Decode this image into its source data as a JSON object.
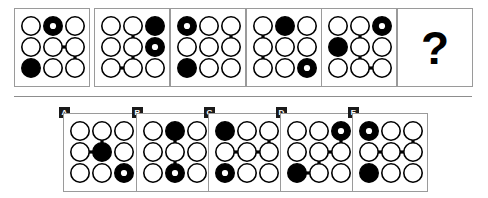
{
  "puzzle": {
    "type": "matrix-reasoning-multiple-choice",
    "question_mark": "?",
    "grid_size": 3,
    "node_states": {
      "empty": "open-circle",
      "filled": "solid-black-circle",
      "dotted": "black-circle-with-white-dot"
    },
    "sequence": [
      {
        "id": "seq-1",
        "nodes": [
          "empty",
          "dotted",
          "empty",
          "empty",
          "empty",
          "empty",
          "filled",
          "empty",
          "empty"
        ],
        "edges": [
          [
            4,
            5
          ],
          [
            5,
            8
          ]
        ]
      },
      {
        "id": "seq-2",
        "nodes": [
          "empty",
          "empty",
          "filled",
          "empty",
          "empty",
          "dotted",
          "empty",
          "empty",
          "empty"
        ],
        "edges": [
          [
            1,
            4
          ],
          [
            4,
            7
          ],
          [
            6,
            7
          ]
        ]
      },
      {
        "id": "seq-3",
        "nodes": [
          "dotted",
          "empty",
          "empty",
          "empty",
          "empty",
          "empty",
          "filled",
          "empty",
          "empty"
        ],
        "edges": [
          [
            2,
            5
          ]
        ]
      },
      {
        "id": "seq-4",
        "nodes": [
          "empty",
          "filled",
          "empty",
          "empty",
          "empty",
          "empty",
          "empty",
          "empty",
          "dotted"
        ],
        "edges": [
          [
            0,
            3
          ],
          [
            3,
            6
          ]
        ]
      },
      {
        "id": "seq-5",
        "nodes": [
          "empty",
          "empty",
          "dotted",
          "filled",
          "empty",
          "empty",
          "empty",
          "empty",
          "empty"
        ],
        "edges": [
          [
            1,
            4
          ],
          [
            4,
            7
          ],
          [
            7,
            8
          ]
        ]
      },
      {
        "id": "seq-6-question",
        "is_question": true,
        "nodes": [],
        "edges": []
      }
    ],
    "options": [
      {
        "id": "option-a",
        "label": "A",
        "nodes": [
          "empty",
          "empty",
          "empty",
          "empty",
          "filled",
          "empty",
          "empty",
          "empty",
          "dotted"
        ],
        "edges": [
          [
            1,
            4
          ],
          [
            3,
            4
          ]
        ]
      },
      {
        "id": "option-b",
        "label": "B",
        "nodes": [
          "empty",
          "filled",
          "empty",
          "empty",
          "empty",
          "empty",
          "empty",
          "dotted",
          "empty"
        ],
        "edges": [
          [
            1,
            4
          ],
          [
            4,
            7
          ]
        ]
      },
      {
        "id": "option-c",
        "label": "C",
        "nodes": [
          "filled",
          "empty",
          "empty",
          "empty",
          "empty",
          "empty",
          "dotted",
          "empty",
          "empty"
        ],
        "edges": [
          [
            2,
            5
          ],
          [
            3,
            4
          ],
          [
            4,
            5
          ]
        ]
      },
      {
        "id": "option-d",
        "label": "D",
        "nodes": [
          "empty",
          "empty",
          "dotted",
          "empty",
          "empty",
          "empty",
          "filled",
          "empty",
          "empty"
        ],
        "edges": [
          [
            2,
            5
          ],
          [
            4,
            5
          ],
          [
            4,
            7
          ],
          [
            6,
            7
          ]
        ]
      },
      {
        "id": "option-e",
        "label": "E",
        "nodes": [
          "dotted",
          "empty",
          "empty",
          "empty",
          "empty",
          "empty",
          "filled",
          "empty",
          "empty"
        ],
        "edges": [
          [
            2,
            5
          ],
          [
            3,
            4
          ],
          [
            4,
            5
          ]
        ]
      }
    ],
    "colors": {
      "stroke": "#000000",
      "fill_black": "#000000",
      "panel_border": "#9a9a9a",
      "divider": "#8d8d8d",
      "background": "#ffffff",
      "label_background": "#1a1a1a",
      "label_text": "#ffffff"
    },
    "layout": {
      "sequence_panels": [
        {
          "x": 14,
          "y": 8,
          "w": 76,
          "h": 79
        },
        {
          "x": 94,
          "y": 8,
          "w": 76,
          "h": 79
        },
        {
          "x": 170,
          "y": 8,
          "w": 76,
          "h": 79
        },
        {
          "x": 246,
          "y": 8,
          "w": 76,
          "h": 79
        },
        {
          "x": 321,
          "y": 8,
          "w": 76,
          "h": 79
        },
        {
          "x": 397,
          "y": 8,
          "w": 76,
          "h": 79
        }
      ],
      "option_panels": [
        {
          "x": 63,
          "y": 113,
          "w": 76,
          "h": 79,
          "label_x": 59,
          "label_y": 107
        },
        {
          "x": 136,
          "y": 113,
          "w": 76,
          "h": 79,
          "label_x": 132,
          "label_y": 107
        },
        {
          "x": 208,
          "y": 113,
          "w": 76,
          "h": 79,
          "label_x": 204,
          "label_y": 107
        },
        {
          "x": 280,
          "y": 113,
          "w": 76,
          "h": 79,
          "label_x": 276,
          "label_y": 107
        },
        {
          "x": 352,
          "y": 113,
          "w": 76,
          "h": 79,
          "label_x": 348,
          "label_y": 107
        }
      ]
    }
  }
}
